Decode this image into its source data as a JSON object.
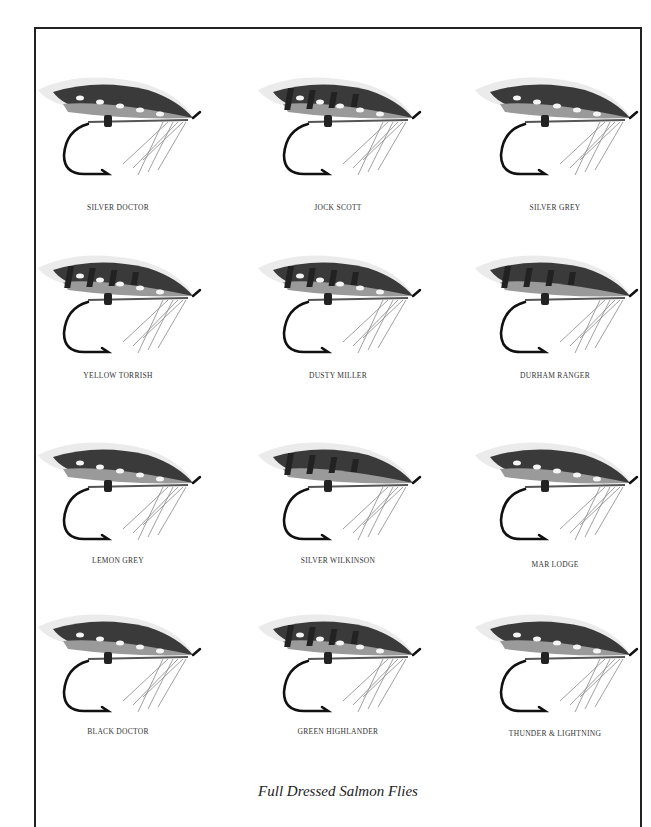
{
  "plate": {
    "caption": "Full Dressed Salmon Flies",
    "flies": [
      {
        "name": "SILVER DOCTOR",
        "x": 18,
        "y": 60,
        "label_y": 143,
        "barred": false,
        "spots": true
      },
      {
        "name": "JOCK SCOTT",
        "x": 238,
        "y": 60,
        "label_y": 143,
        "barred": true,
        "spots": true
      },
      {
        "name": "SILVER GREY",
        "x": 455,
        "y": 60,
        "label_y": 143,
        "barred": false,
        "spots": true
      },
      {
        "name": "YELLOW TORRISH",
        "x": 18,
        "y": 238,
        "label_y": 133,
        "barred": true,
        "spots": true
      },
      {
        "name": "DUSTY MILLER",
        "x": 238,
        "y": 238,
        "label_y": 133,
        "barred": true,
        "spots": true
      },
      {
        "name": "DURHAM RANGER",
        "x": 455,
        "y": 238,
        "label_y": 133,
        "barred": true,
        "spots": false
      },
      {
        "name": "LEMON GREY",
        "x": 18,
        "y": 425,
        "label_y": 131,
        "barred": false,
        "spots": true
      },
      {
        "name": "SILVER WILKINSON",
        "x": 238,
        "y": 425,
        "label_y": 131,
        "barred": true,
        "spots": false
      },
      {
        "name": "MAR LODGE",
        "x": 455,
        "y": 425,
        "label_y": 135,
        "barred": false,
        "spots": true
      },
      {
        "name": "BLACK DOCTOR",
        "x": 18,
        "y": 597,
        "label_y": 130,
        "barred": false,
        "spots": true
      },
      {
        "name": "GREEN HIGHLANDER",
        "x": 238,
        "y": 597,
        "label_y": 130,
        "barred": true,
        "spots": true
      },
      {
        "name": "THUNDER & LIGHTNING",
        "x": 455,
        "y": 597,
        "label_y": 132,
        "barred": false,
        "spots": true
      }
    ]
  }
}
